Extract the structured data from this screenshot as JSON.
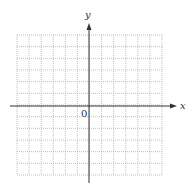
{
  "diagram": {
    "type": "coordinate-grid",
    "x_axis_label": "x",
    "y_axis_label": "y",
    "origin_label": "0",
    "grid": {
      "columns": 12,
      "rows": 12,
      "columns_left_of_y_axis": 6,
      "rows_above_x_axis": 6,
      "line_style": "dotted",
      "line_color": "#b0b0b0"
    },
    "axis_color": "#333333"
  }
}
